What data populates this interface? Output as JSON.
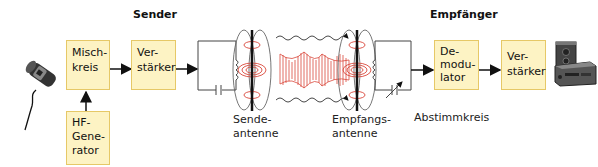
{
  "sections": {
    "sender": "Sender",
    "receiver": "Empfänger"
  },
  "sender_blocks": {
    "mixer": [
      "Misch-",
      "kreis"
    ],
    "amplifier": [
      "Ver-",
      "stärker"
    ],
    "hf_generator": [
      "HF-",
      "Gene-",
      "rator"
    ]
  },
  "receiver_blocks": {
    "demodulator": [
      "De-",
      "modu-",
      "lator"
    ],
    "amplifier": [
      "Ver-",
      "stärker"
    ]
  },
  "labels": {
    "send_antenna": [
      "Sende-",
      "antenne"
    ],
    "receive_antenna": [
      "Empfangs-",
      "antenne"
    ],
    "tuning_circuit": "Abstimmkreis"
  },
  "icons": {
    "input": "microphone-icon",
    "output": "stereo-speaker-icon"
  },
  "colors": {
    "box_fill": "#fdf3c4",
    "box_border": "#e6c867",
    "wave_red": "#d9473b",
    "line": "#333333"
  }
}
